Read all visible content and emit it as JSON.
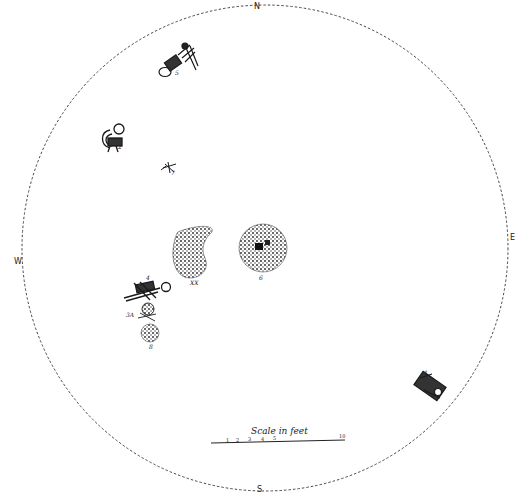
{
  "diagram": {
    "type": "archaeological site plan (burial pit)",
    "boundary": {
      "shape": "circle",
      "style": "dashed",
      "center": [
        265,
        248
      ],
      "radius": 243
    },
    "compass": {
      "north": "N",
      "south": "S",
      "east": "E",
      "west": "W"
    },
    "features": [
      {
        "id": "5",
        "label": "5",
        "kind": "flexed skeleton",
        "position": [
          180,
          58
        ]
      },
      {
        "id": "2",
        "label": "2",
        "kind": "flexed skeleton",
        "position": [
          112,
          140
        ]
      },
      {
        "id": "7",
        "label": "7",
        "kind": "small bone cluster",
        "position": [
          170,
          168
        ]
      },
      {
        "id": "XX",
        "label": "XX",
        "kind": "stippled deposit (crescent)",
        "position": [
          195,
          255
        ]
      },
      {
        "id": "6",
        "label": "6",
        "kind": "stippled circular deposit",
        "position": [
          265,
          250
        ]
      },
      {
        "id": "4",
        "label": "4",
        "kind": "extended skeleton",
        "position": [
          145,
          290
        ]
      },
      {
        "id": "3A",
        "label": "3A",
        "kind": "bone cluster",
        "position": [
          148,
          312
        ]
      },
      {
        "id": "8",
        "label": "8",
        "kind": "stippled circular deposit",
        "position": [
          150,
          335
        ]
      },
      {
        "id": "1",
        "label": "1",
        "kind": "flexed skeleton",
        "position": [
          435,
          385
        ]
      }
    ],
    "scale": {
      "title": "Scale in feet",
      "ticks": [
        "1",
        "2",
        "3",
        "4",
        "5",
        "10"
      ]
    }
  }
}
